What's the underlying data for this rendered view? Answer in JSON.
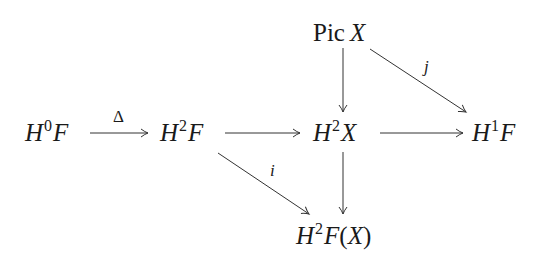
{
  "diagram": {
    "type": "commutative-diagram",
    "nodes": {
      "h0f": {
        "base": "H",
        "sup": "0",
        "rest": "F"
      },
      "h2f": {
        "base": "H",
        "sup": "2",
        "rest": "F"
      },
      "h2x": {
        "base": "H",
        "sup": "2",
        "rest": "X"
      },
      "h1f": {
        "base": "H",
        "sup": "1",
        "rest": "F"
      },
      "picx": {
        "op": "Pic",
        "arg": "X"
      },
      "h2fx": {
        "base": "H",
        "sup": "2",
        "rest": "F",
        "paren_open": "(",
        "arg": "X",
        "paren_close": ")"
      }
    },
    "arrows": [
      {
        "from": "H0F",
        "to": "H2F",
        "label": "Δ"
      },
      {
        "from": "H2F",
        "to": "H2X",
        "label": ""
      },
      {
        "from": "H2X",
        "to": "H1F",
        "label": ""
      },
      {
        "from": "Pic X",
        "to": "H2X",
        "label": ""
      },
      {
        "from": "Pic X",
        "to": "H1F",
        "label": "j"
      },
      {
        "from": "H2X",
        "to": "H2F(X)",
        "label": ""
      },
      {
        "from": "H2F",
        "to": "H2F(X)",
        "label": "i"
      }
    ],
    "labels": {
      "delta": "Δ",
      "j": "j",
      "i": "i"
    }
  }
}
